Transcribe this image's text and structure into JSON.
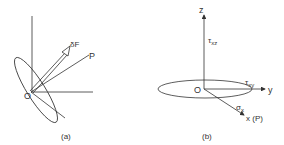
{
  "panel_a": {
    "caption": "(a)",
    "origin_label": "O",
    "force_label": "δF",
    "point_label": "P"
  },
  "panel_b": {
    "caption": "(b)",
    "origin_label": "O",
    "z_label": "z",
    "y_label": "y",
    "x_label": "x (P)",
    "tau_xz": "τ",
    "tau_xz_sub": "xz",
    "tau_xy": "τ",
    "tau_xy_sub": "xy",
    "sigma_x": "σ",
    "sigma_x_sub": "x"
  },
  "colors": {
    "line": "#333333",
    "background": "#ffffff"
  }
}
